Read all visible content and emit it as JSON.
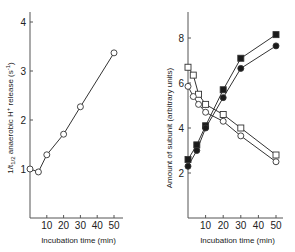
{
  "chart_data": [
    {
      "type": "line",
      "title": "",
      "xlabel": "Incubation time (min)",
      "ylabel": "1/t1/2 anaerobic H+ release (s-1)",
      "ylabel_parts": {
        "pre": "1/t",
        "sub": "1/2",
        "mid": " anaerobic H",
        "sup": "+",
        "post": " release (s",
        "sup2": "-1",
        "end": ")"
      },
      "xlim": [
        0,
        55
      ],
      "ylim": [
        0,
        4.2
      ],
      "xticks": [
        10,
        20,
        30,
        40,
        50
      ],
      "yticks": [
        1,
        2,
        3,
        4
      ],
      "grid": false,
      "series": [
        {
          "name": "H+ release rate",
          "marker": "open-circle",
          "x": [
            0,
            5,
            10,
            20,
            30,
            50
          ],
          "y": [
            1.0,
            0.94,
            1.29,
            1.71,
            2.27,
            3.37
          ]
        }
      ]
    },
    {
      "type": "line",
      "title": "",
      "xlabel": "Incubation time (min)",
      "ylabel": "Amount of subunit (arbitrary units)",
      "xlim": [
        0,
        55
      ],
      "ylim": [
        0,
        9
      ],
      "xticks": [
        10,
        20,
        30,
        40,
        50
      ],
      "yticks": [
        2,
        4,
        6,
        8
      ],
      "grid": false,
      "series": [
        {
          "name": "filled squares",
          "marker": "filled-square",
          "x": [
            0,
            5,
            10,
            20,
            30,
            50
          ],
          "y": [
            2.6,
            3.25,
            4.1,
            5.7,
            7.1,
            8.15
          ]
        },
        {
          "name": "filled circles",
          "marker": "filled-circle",
          "x": [
            0,
            5,
            10,
            20,
            30,
            50
          ],
          "y": [
            2.3,
            3.0,
            4.0,
            5.35,
            6.65,
            7.65
          ]
        },
        {
          "name": "open squares",
          "marker": "open-square",
          "x": [
            0,
            3,
            6,
            10,
            20,
            30,
            50
          ],
          "y": [
            6.7,
            6.35,
            5.5,
            5.05,
            4.6,
            4.0,
            2.8
          ]
        },
        {
          "name": "open circles",
          "marker": "open-circle",
          "x": [
            0,
            3,
            6,
            10,
            20,
            30,
            50
          ],
          "y": [
            5.85,
            5.4,
            5.05,
            4.7,
            4.3,
            3.65,
            2.5
          ]
        }
      ]
    }
  ]
}
